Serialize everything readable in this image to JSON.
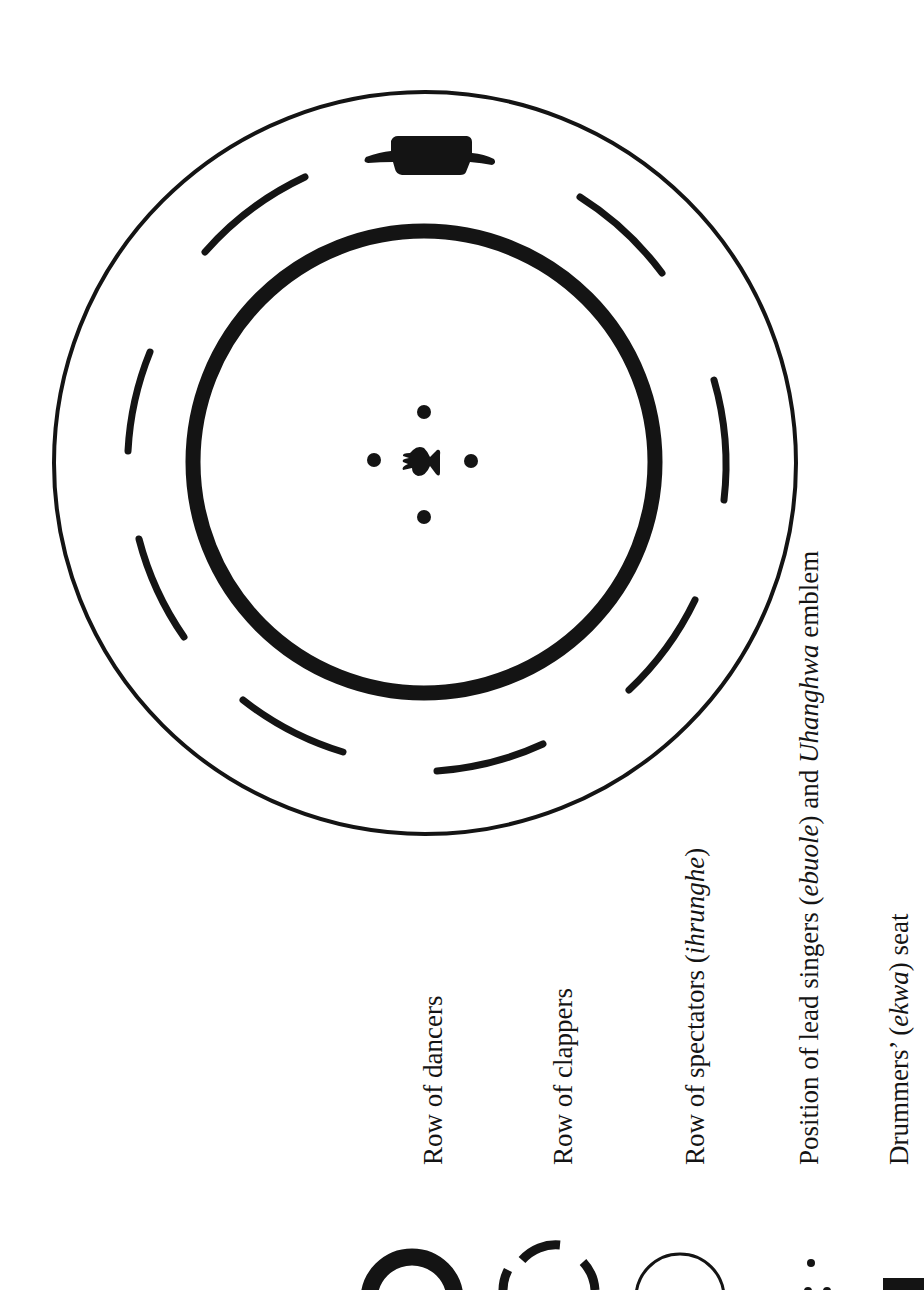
{
  "figure": {
    "colors": {
      "ink": "#141414",
      "paper": "#ffffff"
    },
    "arena": {
      "center": [
        423,
        462
      ],
      "outer_circle": {
        "name": "Row of spectators",
        "radius": 373,
        "stroke": 4
      },
      "middle_dashed_ring": {
        "name": "Row of clappers",
        "radius": 300,
        "stroke": 7,
        "segments": 8
      },
      "inner_circle": {
        "name": "Row of dancers",
        "radius": 230,
        "stroke": 15
      },
      "drummers_seat": {
        "name": "Drummers' seat",
        "position": "top of middle ring"
      },
      "center_emblem": {
        "name": "Lead singers and Uhanghwa emblem",
        "dots": 4
      }
    }
  },
  "legend": {
    "items": [
      {
        "symbol": "thick-circle",
        "text": "Row of dancers",
        "italic": "",
        "suffix": ""
      },
      {
        "symbol": "dashed-circle",
        "text": "Row of clappers",
        "italic": "",
        "suffix": ""
      },
      {
        "symbol": "thin-circle",
        "text": "Row of spectators (",
        "italic": "ihrunghe",
        "suffix": ")"
      },
      {
        "symbol": "dots-emblem",
        "text": "Position of lead singers (",
        "italic": "ebuole",
        "suffix": ") and ",
        "italic2": "Uhanghwa",
        "suffix2": " emblem"
      },
      {
        "symbol": "seat-block",
        "text": "Drummers’ (",
        "italic": "ekwa",
        "suffix": ") seat"
      }
    ]
  }
}
